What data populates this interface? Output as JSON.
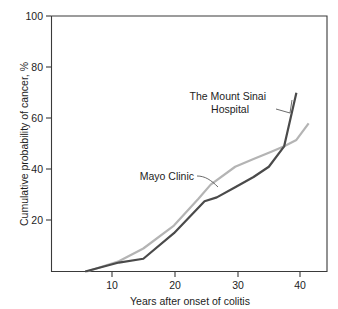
{
  "chart_data": {
    "type": "line",
    "title": "",
    "xlabel": "Years after onset of colitis",
    "ylabel": "Cumulative probability of cancer, %",
    "xlim": [
      0,
      45
    ],
    "ylim": [
      0,
      100
    ],
    "grid": false,
    "legend_position": "inline-annotations",
    "xticks": [
      10,
      20,
      30,
      40
    ],
    "yticks": [
      20,
      40,
      60,
      80,
      100
    ],
    "series": [
      {
        "name": "The Mount Sinai Hospital",
        "color": "#4a4a4a",
        "x": [
          5.5,
          11,
          15,
          20,
          25,
          27,
          30,
          33,
          35.5,
          38,
          40
        ],
        "values": [
          0,
          3.5,
          5,
          15,
          27.5,
          29,
          33,
          37,
          41,
          49,
          70
        ]
      },
      {
        "name": "Mayo Clinic",
        "color": "#b4b4b4",
        "x": [
          5.8,
          11,
          15,
          20,
          24,
          26,
          30,
          33,
          36,
          38,
          40,
          42
        ],
        "values": [
          0,
          4,
          9,
          18,
          28.5,
          34,
          41,
          44,
          47,
          49,
          51.5,
          58
        ]
      }
    ],
    "annotations": [
      {
        "name": "mount-sinai-label",
        "text_lines": [
          "The Mount Sinai",
          "Hospital"
        ],
        "text_x": 193,
        "text_y": 98,
        "leader": "M 276 109 L 290 113 L 292 100"
      },
      {
        "name": "mayo-clinic-label",
        "text_lines": [
          "Mayo Clinic"
        ],
        "text_x": 133,
        "text_y": 180,
        "leader": "M 200 176 C 208 176 213 180 219 186"
      }
    ]
  },
  "axes": {
    "y_tick_labels": [
      "100",
      "80",
      "60",
      "40",
      "20"
    ],
    "x_tick_labels": [
      "10",
      "20",
      "30",
      "40"
    ],
    "x_title": "Years after onset of colitis",
    "y_title": "Cumulative probability of cancer, %"
  },
  "colors": {
    "mount_sinai": "#4a4a4a",
    "mayo_clinic": "#b4b4b4",
    "axis": "#3a3a3a",
    "background": "#ffffff"
  }
}
